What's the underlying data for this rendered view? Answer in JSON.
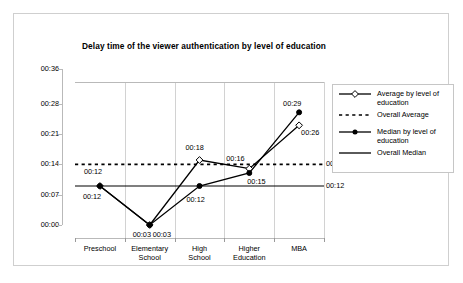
{
  "chart_data": {
    "type": "line",
    "title": "Delay time of the viewer authentication by level of education",
    "xlabel": "",
    "ylabel": "",
    "categories": [
      "Preschool",
      "Elementary School",
      "High School",
      "Higher Education",
      "MBA"
    ],
    "category_lines": [
      [
        "Preschool"
      ],
      [
        "Elementary",
        "School"
      ],
      [
        "High",
        "School"
      ],
      [
        "Higher",
        "Education"
      ],
      [
        "MBA"
      ]
    ],
    "ytick_labels": [
      "00:36",
      "00:28",
      "00:21",
      "00:14",
      "00:07",
      "00:00"
    ],
    "ytick_values": [
      36,
      28,
      21,
      14,
      7,
      0
    ],
    "ylim": [
      0,
      36
    ],
    "grid": "vertical",
    "legend_position": "right",
    "series": [
      {
        "name": "Average by level of education",
        "marker": "open-diamond",
        "style": "solid",
        "values": [
          12,
          3,
          18,
          16,
          26
        ],
        "labels": [
          "00:12",
          "00:03",
          "00:18",
          "00:16",
          "00:26"
        ]
      },
      {
        "name": "Median by level of education",
        "marker": "filled-circle",
        "style": "solid",
        "values": [
          12,
          3,
          12,
          15,
          29
        ],
        "labels": [
          "00:12",
          "00:03",
          "00:12",
          "00:15",
          "00:29"
        ]
      }
    ],
    "reference_lines": [
      {
        "name": "Overall Average",
        "style": "dashed",
        "value": 17,
        "label": "00:17"
      },
      {
        "name": "Overall Median",
        "style": "solid",
        "value": 12,
        "label": "00:12"
      }
    ]
  },
  "legend": {
    "items": [
      {
        "label_lines": [
          "Average by level of",
          "education"
        ],
        "marker": "open-diamond-line"
      },
      {
        "label_lines": [
          "Overall Average"
        ],
        "marker": "dashed-line"
      },
      {
        "label_lines": [
          "Median by level of",
          "education"
        ],
        "marker": "filled-circle-line"
      },
      {
        "label_lines": [
          "Overall Median"
        ],
        "marker": "solid-line"
      }
    ]
  },
  "colors": {
    "series_line": "#000000",
    "grid": "#d2d2d2",
    "axis": "#b9b9b9",
    "border": "#cfcfcf",
    "background": "#ffffff"
  }
}
